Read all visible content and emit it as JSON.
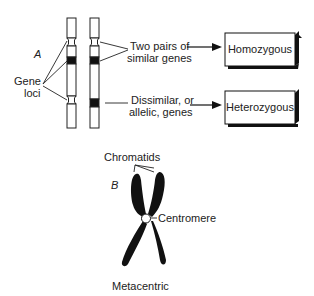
{
  "panel_a": {
    "label": "A",
    "gene_loci_label": [
      "Gene",
      "loci"
    ],
    "similar_label": [
      "Two pairs of",
      "similar genes"
    ],
    "dissimilar_label": [
      "Dissimilar, or",
      "allelic, genes"
    ],
    "box_top": "Homozygous",
    "box_bottom": "Heterozygous"
  },
  "panel_b": {
    "label": "B",
    "chromatids_label": "Chromatids",
    "centromere_label": "Centromere",
    "type_label": "Metacentric"
  }
}
